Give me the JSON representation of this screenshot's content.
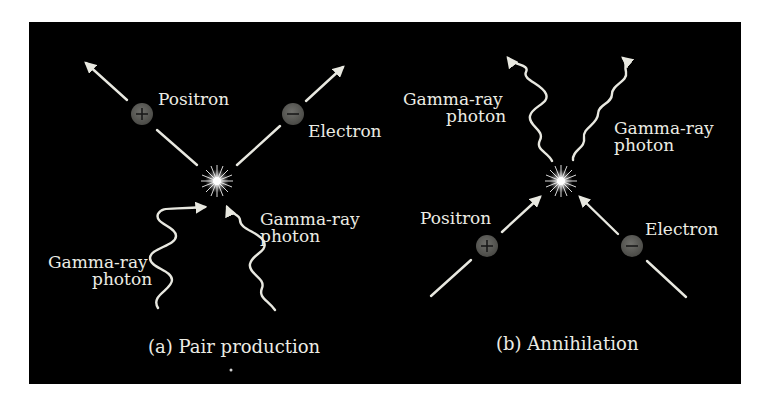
{
  "diagram": {
    "background_color": "#000000",
    "foreground_color": "#ecece4",
    "particle_color": "#5e5e5a",
    "panels": [
      {
        "id": "a",
        "caption": "(a)  Pair production",
        "labels": {
          "positron": "Positron",
          "electron": "Electron",
          "gamma_left_line1": "Gamma-ray",
          "gamma_left_line2": "photon",
          "gamma_right_line1": "Gamma-ray",
          "gamma_right_line2": "photon"
        },
        "particles": [
          {
            "name": "positron",
            "sign": "+"
          },
          {
            "name": "electron",
            "sign": "−"
          }
        ]
      },
      {
        "id": "b",
        "caption": "(b)  Annihilation",
        "labels": {
          "positron": "Positron",
          "electron": "Electron",
          "gamma_left_line1": "Gamma-ray",
          "gamma_left_line2": "photon",
          "gamma_right_line1": "Gamma-ray",
          "gamma_right_line2": "photon"
        },
        "particles": [
          {
            "name": "positron",
            "sign": "+"
          },
          {
            "name": "electron",
            "sign": "−"
          }
        ]
      }
    ]
  }
}
